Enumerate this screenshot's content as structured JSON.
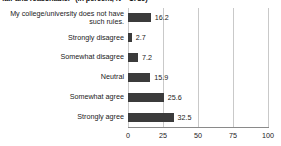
{
  "chart_data": {
    "type": "bar",
    "orientation": "horizontal",
    "title": "fair and reasonable.\"  (in percent, N = 1789)",
    "xlabel": "",
    "ylabel": "",
    "xlim": [
      0,
      100
    ],
    "xticks": [
      0,
      25,
      50,
      75,
      100
    ],
    "xtick_labels": [
      "0",
      "25",
      "50",
      "75",
      "100"
    ],
    "grid": true,
    "legend": false,
    "bar_color": "#3b3b3b",
    "gridline_color": "#c9c9c9",
    "axis_color": "#8a8a8a",
    "categories": [
      "My college/university does not have\nsuch rules.",
      "Strongly disagree",
      "Somewhat disagree",
      "Neutral",
      "Somewhat agree",
      "Strongly agree"
    ],
    "values": [
      16.2,
      2.7,
      7.2,
      15.9,
      25.6,
      32.5
    ],
    "value_labels": [
      "16.2",
      "2.7",
      "7.2",
      "15.9",
      "25.6",
      "32.5"
    ]
  }
}
